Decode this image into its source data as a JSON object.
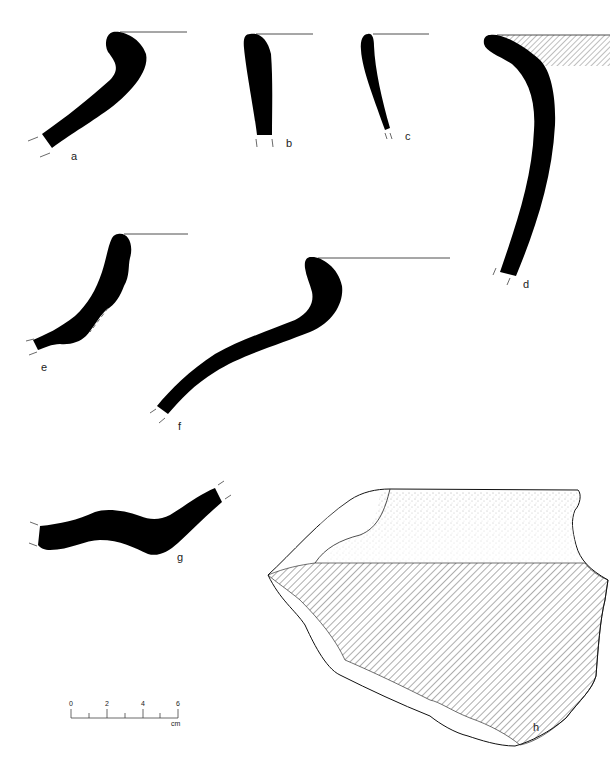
{
  "figure": {
    "labels": {
      "a": "a",
      "b": "b",
      "c": "c",
      "d": "d",
      "e": "e",
      "f": "f",
      "g": "g",
      "h": "h"
    },
    "scale_bar": {
      "ticks": [
        "0",
        "2",
        "4",
        "6"
      ],
      "unit": "cm"
    },
    "colors": {
      "profile_fill": "#000000",
      "line": "#222222",
      "background": "#ffffff"
    }
  }
}
